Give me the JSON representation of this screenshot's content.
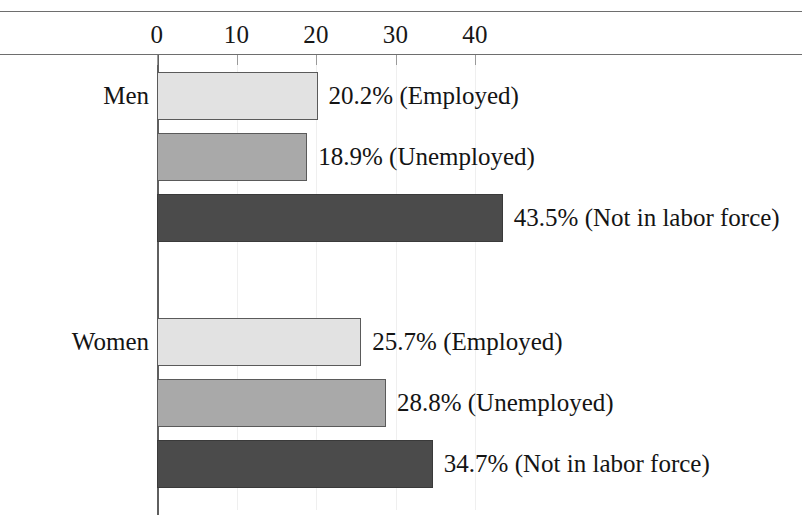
{
  "chart_data": {
    "type": "bar",
    "orientation": "horizontal",
    "title": "",
    "xlabel": "",
    "ylabel": "",
    "xlim": [
      0,
      50
    ],
    "xticks": [
      0,
      10,
      20,
      30,
      40
    ],
    "xtick_labels": [
      "0",
      "10",
      "20",
      "30",
      "40"
    ],
    "grid": true,
    "grid_axis": "x",
    "legend": "none",
    "groups": [
      "Men",
      "Women"
    ],
    "categories": [
      "Employed",
      "Unemployed",
      "Not in labor force"
    ],
    "series": [
      {
        "name": "Men",
        "values": [
          20.2,
          18.9,
          43.5
        ]
      },
      {
        "name": "Women",
        "values": [
          25.7,
          28.8,
          34.7
        ]
      }
    ],
    "bars": [
      {
        "group": "Men",
        "category": "Employed",
        "value": 20.2,
        "label": "20.2% (Employed)",
        "color": "#e2e2e2"
      },
      {
        "group": "Men",
        "category": "Unemployed",
        "value": 18.9,
        "label": "18.9% (Unemployed)",
        "color": "#a9a9a9"
      },
      {
        "group": "Men",
        "category": "Not in labor force",
        "value": 43.5,
        "label": "43.5% (Not in labor force)",
        "color": "#4b4b4b"
      },
      {
        "group": "Women",
        "category": "Employed",
        "value": 25.7,
        "label": "25.7% (Employed)",
        "color": "#e2e2e2"
      },
      {
        "group": "Women",
        "category": "Unemployed",
        "value": 28.8,
        "label": "28.8% (Unemployed)",
        "color": "#a9a9a9"
      },
      {
        "group": "Women",
        "category": "Not in labor force",
        "value": 34.7,
        "label": "34.7% (Not in labor force)",
        "color": "#4b4b4b"
      }
    ],
    "group_labels": [
      {
        "text": "Men",
        "anchor_bar": 0
      },
      {
        "text": "Women",
        "anchor_bar": 3
      }
    ],
    "value_unit": "%"
  },
  "colors": {
    "employed": "#e2e2e2",
    "unemployed": "#a9a9a9",
    "not_in_labor_force": "#4b4b4b",
    "bar_outline": "#5a5a5a",
    "axis": "#5f5f5f",
    "rule": "#6e6e6e",
    "gridline": "#efefef",
    "text": "#141414",
    "background": "#ffffff"
  }
}
